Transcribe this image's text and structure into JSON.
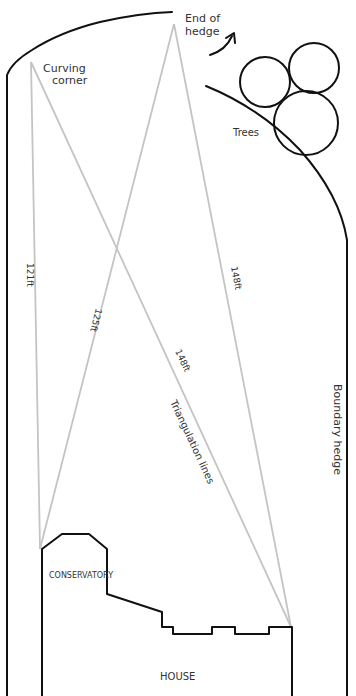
{
  "diagram": {
    "colors": {
      "outline": "#111111",
      "triangulation": "#c4c4c4",
      "label_text": "#333333",
      "background": "#ffffff"
    },
    "labels": {
      "curving_corner_line1": "Curving",
      "curving_corner_line2": "corner",
      "end_of_hedge_line1": "End of",
      "end_of_hedge_line2": "hedge",
      "trees": "Trees",
      "boundary_hedge": "Boundary hedge",
      "triangulation_lines": "Triangulation lines",
      "conservatory": "CONSERVATORY",
      "house": "HOUSE"
    },
    "measurements": [
      {
        "id": "corner-to-conservatory",
        "label": "121ft"
      },
      {
        "id": "hedge-end-to-conservatory",
        "label": "125ft"
      },
      {
        "id": "corner-to-house",
        "label": "148ft"
      },
      {
        "id": "hedge-end-to-house",
        "label": "148ft"
      }
    ]
  }
}
